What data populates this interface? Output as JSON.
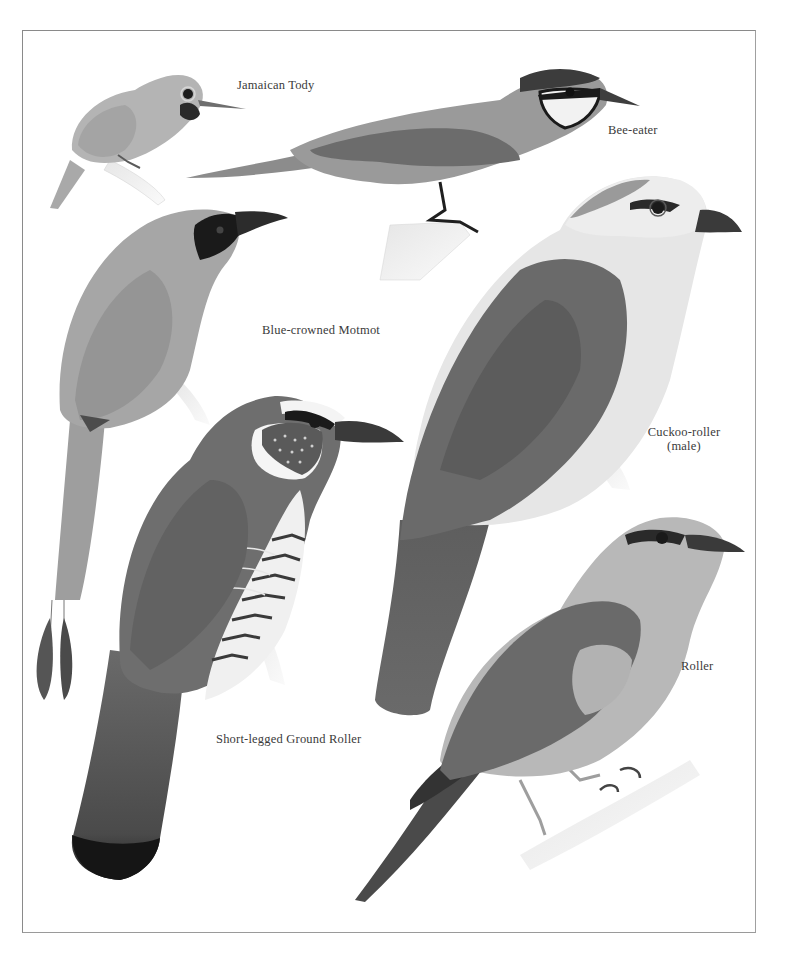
{
  "plate": {
    "border_color": "#8a8a8a",
    "background": "#ffffff",
    "birds": [
      {
        "id": "jamaican-tody",
        "label": "Jamaican Tody"
      },
      {
        "id": "bee-eater",
        "label": "Bee-eater"
      },
      {
        "id": "blue-crowned-motmot",
        "label": "Blue-crowned Motmot"
      },
      {
        "id": "cuckoo-roller",
        "label": "Cuckoo-roller",
        "sublabel": "(male)"
      },
      {
        "id": "roller",
        "label": "Roller"
      },
      {
        "id": "short-legged-ground-roller",
        "label": "Short-legged Ground Roller"
      }
    ]
  }
}
